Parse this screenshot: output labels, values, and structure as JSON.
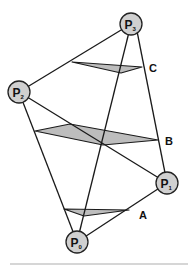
{
  "diagram": {
    "nodes": [
      {
        "id": "P0",
        "letter": "P",
        "sub": "0",
        "x": 77,
        "y": 242
      },
      {
        "id": "P1",
        "letter": "P",
        "sub": "1",
        "x": 167,
        "y": 183
      },
      {
        "id": "P2",
        "letter": "P",
        "sub": "2",
        "x": 19,
        "y": 92
      },
      {
        "id": "P3",
        "letter": "P",
        "sub": "3",
        "x": 131,
        "y": 24
      }
    ],
    "edges": [
      [
        "P3",
        "P2"
      ],
      [
        "P3",
        "P0"
      ],
      [
        "P3",
        "P1"
      ],
      [
        "P2",
        "P1"
      ],
      [
        "P2",
        "P0"
      ],
      [
        "P0",
        "P1"
      ]
    ],
    "sections": [
      {
        "label": "A",
        "label_x": 140,
        "label_y": 218
      },
      {
        "label": "B",
        "label_x": 166,
        "label_y": 145
      },
      {
        "label": "C",
        "label_x": 149,
        "label_y": 72
      }
    ],
    "colors": {
      "shade": "#bdbdbd",
      "node_fill": "#d0d0d0",
      "line": "#1a1a1a"
    }
  }
}
